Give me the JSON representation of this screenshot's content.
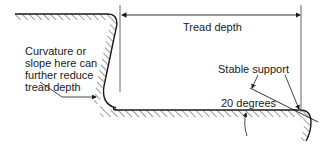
{
  "diagram": {
    "type": "stair-tread-cross-section",
    "labels": {
      "tread_depth": "Tread depth",
      "curvature_note": [
        "Curvature or",
        "slope here can",
        "further reduce",
        "tread depth"
      ],
      "stable_support": "Stable support",
      "angle": "20 degrees"
    },
    "colors": {
      "line": "#1a1a1a",
      "hatch": "#333333",
      "dimension": "#555555",
      "background": "#ffffff"
    }
  }
}
